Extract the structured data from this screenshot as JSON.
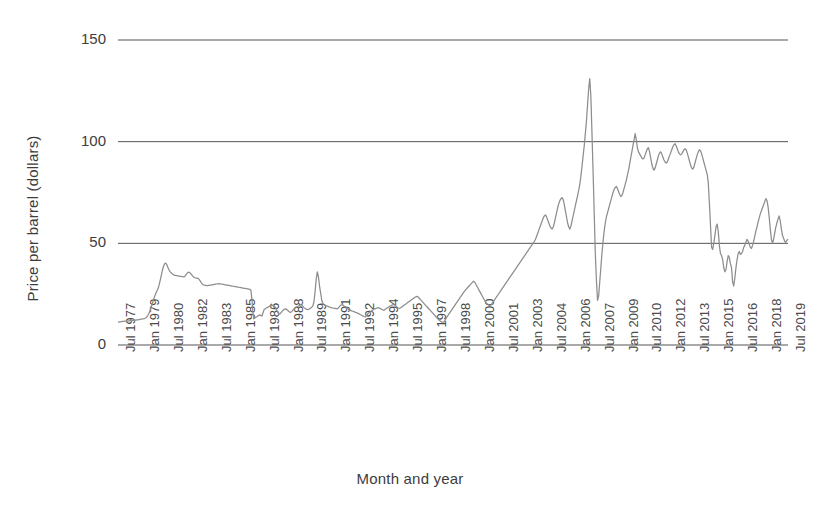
{
  "chart_data": {
    "type": "line",
    "title": "",
    "xlabel": "Month and year",
    "ylabel": "Price per barrel (dollars)",
    "ylim": [
      0,
      150
    ],
    "yticks": [
      0,
      50,
      100,
      150
    ],
    "grid": "horizontal",
    "legend": "none",
    "line_color": "#8d8d8d",
    "axis_color": "#555555",
    "background": "#ffffff",
    "x_start": "Jul 1977",
    "x_end": "Jul 2019",
    "x_interval_months": 1,
    "tick_interval_months": 18,
    "tick_labels": [
      "Jul 1977",
      "Jan 1979",
      "Jul 1980",
      "Jan 1982",
      "Jul 1983",
      "Jan 1985",
      "Jul 1986",
      "Jan 1988",
      "Jul 1989",
      "Jan 1991",
      "Jul 1992",
      "Jan 1994",
      "Jul 1995",
      "Jan 1997",
      "Jul 1998",
      "Jan 2000",
      "Jul 2001",
      "Jan 2003",
      "Jul 2004",
      "Jan 2006",
      "Jul 2007",
      "Jan 2009",
      "Jul 2010",
      "Jan 2012",
      "Jul 2013",
      "Jan 2015",
      "Jul 2016",
      "Jan 2018",
      "Jul 2019"
    ],
    "series": [
      {
        "name": "Crude oil price",
        "values": [
          11.2,
          11.3,
          11.4,
          11.5,
          11.6,
          11.6,
          11.7,
          11.8,
          11.8,
          11.9,
          11.9,
          12.0,
          12.0,
          12.1,
          12.1,
          12.2,
          12.2,
          12.3,
          12.4,
          12.5,
          12.6,
          12.7,
          12.8,
          12.9,
          13.0,
          13.3,
          13.8,
          14.6,
          15.6,
          17.0,
          18.6,
          20.4,
          22.1,
          23.8,
          25.2,
          26.4,
          27.5,
          29.2,
          31.5,
          34.0,
          36.5,
          38.5,
          39.8,
          40.3,
          39.6,
          38.2,
          37.0,
          36.1,
          35.5,
          35.0,
          34.6,
          34.3,
          34.2,
          34.1,
          34.0,
          33.9,
          33.8,
          33.7,
          33.6,
          33.5,
          33.6,
          34.2,
          35.0,
          35.6,
          35.8,
          35.5,
          34.9,
          34.2,
          33.6,
          33.2,
          33.0,
          32.9,
          32.8,
          32.4,
          31.7,
          30.8,
          30.0,
          29.6,
          29.4,
          29.3,
          29.2,
          29.2,
          29.3,
          29.4,
          29.5,
          29.6,
          29.7,
          29.8,
          29.9,
          30.0,
          30.1,
          30.2,
          30.1,
          30.0,
          29.9,
          29.8,
          29.7,
          29.6,
          29.5,
          29.4,
          29.3,
          29.2,
          29.1,
          29.0,
          28.9,
          28.8,
          28.7,
          28.6,
          28.5,
          28.4,
          28.3,
          28.2,
          28.1,
          28.0,
          27.9,
          27.8,
          27.7,
          27.6,
          27.5,
          27.4,
          26.9,
          22.0,
          15.0,
          13.0,
          13.5,
          13.8,
          14.2,
          14.5,
          14.8,
          14.6,
          14.2,
          16.0,
          17.5,
          17.8,
          18.2,
          18.5,
          18.8,
          19.1,
          19.4,
          19.6,
          19.4,
          19.2,
          18.6,
          17.5,
          16.3,
          15.5,
          15.2,
          15.7,
          16.4,
          17.0,
          17.5,
          17.8,
          17.6,
          17.2,
          16.6,
          16.2,
          16.1,
          16.5,
          17.2,
          17.8,
          18.2,
          18.6,
          18.9,
          19.2,
          19.6,
          19.9,
          19.6,
          19.0,
          18.4,
          17.9,
          17.6,
          17.4,
          17.5,
          17.8,
          18.2,
          18.6,
          19.3,
          21.4,
          26.5,
          32.5,
          36.0,
          33.5,
          29.0,
          25.5,
          22.0,
          20.5,
          19.8,
          19.5,
          19.3,
          19.1,
          18.9,
          18.7,
          18.5,
          18.3,
          18.2,
          18.1,
          18.0,
          17.9,
          17.8,
          18.2,
          19.0,
          19.5,
          19.8,
          19.6,
          19.2,
          18.8,
          18.4,
          18.0,
          17.6,
          17.2,
          17.0,
          16.8,
          16.6,
          16.4,
          16.2,
          16.0,
          15.8,
          15.5,
          15.2,
          14.9,
          14.6,
          14.3,
          14.0,
          13.8,
          14.2,
          15.0,
          15.6,
          16.0,
          16.4,
          16.8,
          17.2,
          17.6,
          17.8,
          18.0,
          18.2,
          18.4,
          18.2,
          17.9,
          17.6,
          17.3,
          17.1,
          17.4,
          17.8,
          18.2,
          18.6,
          18.9,
          19.2,
          19.5,
          19.8,
          20.0,
          19.7,
          19.2,
          18.6,
          18.2,
          18.0,
          18.2,
          18.6,
          19.0,
          19.4,
          19.8,
          20.2,
          20.6,
          21.0,
          21.4,
          21.8,
          22.2,
          22.6,
          23.0,
          23.4,
          23.7,
          23.9,
          23.6,
          23.0,
          22.4,
          21.8,
          21.2,
          20.6,
          20.0,
          19.4,
          18.8,
          18.2,
          17.6,
          17.0,
          16.4,
          15.8,
          15.2,
          14.6,
          14.0,
          13.4,
          12.8,
          12.2,
          11.8,
          11.4,
          11.2,
          11.3,
          11.8,
          12.8,
          13.8,
          14.6,
          15.4,
          16.2,
          17.0,
          17.8,
          18.6,
          19.4,
          20.2,
          21.0,
          21.8,
          22.6,
          23.4,
          24.2,
          25.0,
          25.8,
          26.5,
          27.2,
          27.8,
          28.4,
          29.0,
          29.6,
          30.2,
          30.8,
          31.4,
          31.0,
          30.0,
          29.0,
          28.0,
          27.0,
          26.0,
          25.0,
          24.0,
          23.0,
          22.0,
          21.0,
          20.4,
          20.0,
          19.6,
          19.4,
          19.8,
          20.6,
          21.4,
          22.2,
          23.0,
          23.8,
          24.6,
          25.4,
          26.2,
          27.0,
          27.8,
          28.6,
          29.4,
          30.2,
          31.0,
          31.8,
          32.6,
          33.4,
          34.2,
          35.0,
          35.8,
          36.6,
          37.4,
          38.2,
          39.0,
          39.8,
          40.6,
          41.4,
          42.2,
          43.0,
          43.8,
          44.6,
          45.4,
          46.2,
          47.0,
          47.8,
          48.6,
          49.4,
          50.2,
          51.0,
          52.0,
          53.5,
          55.0,
          56.5,
          58.0,
          59.5,
          61.0,
          62.5,
          63.5,
          64.0,
          63.0,
          61.5,
          60.0,
          58.5,
          57.5,
          57.0,
          58.0,
          60.0,
          62.5,
          65.0,
          67.5,
          69.5,
          71.0,
          72.0,
          72.5,
          71.5,
          69.0,
          66.0,
          63.0,
          60.0,
          58.0,
          57.0,
          58.5,
          61.0,
          63.5,
          66.0,
          68.5,
          71.0,
          73.5,
          76.0,
          79.0,
          83.0,
          88.0,
          93.0,
          98.0,
          104.0,
          110.0,
          118.0,
          126.0,
          131.0,
          122.0,
          104.0,
          85.0,
          65.0,
          45.0,
          32.0,
          22.0,
          24.0,
          31.0,
          38.0,
          45.0,
          51.0,
          56.0,
          60.0,
          63.0,
          65.0,
          67.0,
          69.0,
          71.0,
          73.0,
          75.0,
          76.5,
          77.5,
          78.0,
          77.0,
          75.5,
          74.0,
          73.0,
          73.5,
          75.0,
          77.0,
          79.0,
          81.0,
          83.5,
          86.0,
          89.0,
          92.0,
          95.0,
          98.0,
          101.0,
          104.0,
          101.0,
          97.0,
          95.0,
          94.0,
          93.0,
          92.0,
          91.5,
          92.0,
          93.5,
          95.0,
          96.5,
          97.0,
          95.0,
          92.0,
          89.0,
          87.0,
          86.0,
          87.0,
          89.0,
          91.0,
          93.0,
          94.5,
          95.0,
          94.0,
          92.5,
          91.0,
          90.0,
          89.5,
          90.0,
          91.5,
          93.0,
          94.5,
          96.0,
          97.5,
          98.5,
          99.0,
          98.0,
          96.5,
          95.0,
          94.0,
          93.5,
          94.0,
          95.0,
          96.0,
          96.5,
          96.0,
          94.5,
          92.5,
          90.5,
          88.5,
          87.0,
          86.5,
          87.5,
          89.5,
          91.5,
          93.5,
          95.0,
          96.0,
          95.5,
          94.0,
          92.0,
          90.0,
          88.0,
          86.0,
          84.0,
          80.0,
          70.0,
          59.0,
          48.0,
          47.0,
          50.0,
          54.0,
          58.0,
          59.5,
          56.0,
          49.0,
          45.0,
          44.0,
          42.0,
          38.0,
          36.0,
          37.0,
          41.0,
          44.0,
          43.0,
          40.0,
          38.0,
          31.0,
          29.0,
          33.0,
          38.0,
          42.0,
          45.0,
          46.0,
          44.5,
          45.0,
          46.0,
          48.0,
          49.0,
          50.5,
          52.0,
          51.0,
          49.5,
          48.0,
          47.5,
          49.0,
          51.0,
          53.5,
          56.0,
          58.0,
          60.5,
          62.5,
          64.5,
          66.0,
          67.5,
          69.0,
          70.5,
          72.0,
          71.0,
          68.0,
          63.0,
          57.0,
          52.0,
          50.0,
          52.0,
          55.0,
          58.0,
          60.0,
          62.0,
          63.5,
          61.0,
          57.0,
          54.0,
          52.5,
          51.0,
          50.5,
          51.5,
          52.0
        ]
      }
    ],
    "key_points": [
      {
        "label": "Jul 1977 start",
        "value": 11.2
      },
      {
        "label": "1980 oil crisis peak",
        "value": 40.3
      },
      {
        "label": "1986 price collapse",
        "value": 13.0
      },
      {
        "label": "1990 Gulf War spike",
        "value": 36.0
      },
      {
        "label": "Dec 1998 low",
        "value": 11.2
      },
      {
        "label": "Jun 2008 peak",
        "value": 131.0
      },
      {
        "label": "Dec 2008 trough",
        "value": 22.0
      },
      {
        "label": "2011-2014 plateau",
        "value": 95.0
      },
      {
        "label": "Feb 2016 low",
        "value": 29.0
      },
      {
        "label": "Jul 2019 end",
        "value": 52.0
      }
    ]
  }
}
